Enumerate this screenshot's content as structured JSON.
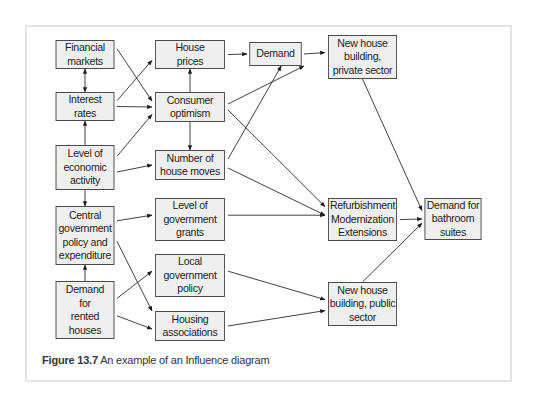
{
  "figure": {
    "caption_label": "Figure 13.7",
    "caption_text": " An example of an Influence diagram"
  },
  "nodes": {
    "financial_markets": "Financial\nmarkets",
    "interest_rates": "Interest\nrates",
    "economic_activity": "Level of\neconomic\nactivity",
    "central_government": "Central\ngovernment\npolicy and\nexpenditure",
    "demand_rented": "Demand\nfor\nrented\nhouses",
    "house_prices": "House\nprices",
    "consumer_optimism": "Consumer\noptimism",
    "house_moves": "Number of\nhouse moves",
    "government_grants": "Level of\ngovernment\ngrants",
    "local_government": "Local\ngovernment\npolicy",
    "housing_associations": "Housing\nassociations",
    "demand": "Demand",
    "new_private": "New house\nbuilding,\nprivate sector",
    "refurbishment": "Refurbishment\nModernization\nExtensions",
    "bathroom": "Demand for\nbathroom\nsuites",
    "new_public": "New house\nbuilding, public\nsector"
  },
  "edges": [
    {
      "from": "financial_markets",
      "to": "interest_rates",
      "bidirectional": true
    },
    {
      "from": "financial_markets",
      "to": "consumer_optimism"
    },
    {
      "from": "interest_rates",
      "to": "house_prices"
    },
    {
      "from": "interest_rates",
      "to": "consumer_optimism"
    },
    {
      "from": "economic_activity",
      "to": "interest_rates"
    },
    {
      "from": "economic_activity",
      "to": "consumer_optimism"
    },
    {
      "from": "economic_activity",
      "to": "house_moves"
    },
    {
      "from": "economic_activity",
      "to": "central_government"
    },
    {
      "from": "consumer_optimism",
      "to": "house_prices"
    },
    {
      "from": "consumer_optimism",
      "to": "house_moves"
    },
    {
      "from": "consumer_optimism",
      "to": "demand"
    },
    {
      "from": "consumer_optimism",
      "to": "refurbishment"
    },
    {
      "from": "house_moves",
      "to": "demand"
    },
    {
      "from": "house_moves",
      "to": "refurbishment"
    },
    {
      "from": "house_prices",
      "to": "demand"
    },
    {
      "from": "demand",
      "to": "new_private"
    },
    {
      "from": "new_private",
      "to": "bathroom"
    },
    {
      "from": "central_government",
      "to": "government_grants"
    },
    {
      "from": "central_government",
      "to": "housing_associations"
    },
    {
      "from": "demand_rented",
      "to": "central_government"
    },
    {
      "from": "demand_rented",
      "to": "local_government"
    },
    {
      "from": "demand_rented",
      "to": "housing_associations"
    },
    {
      "from": "government_grants",
      "to": "refurbishment"
    },
    {
      "from": "local_government",
      "to": "new_public"
    },
    {
      "from": "housing_associations",
      "to": "new_public"
    },
    {
      "from": "refurbishment",
      "to": "bathroom"
    },
    {
      "from": "new_public",
      "to": "bathroom"
    }
  ]
}
